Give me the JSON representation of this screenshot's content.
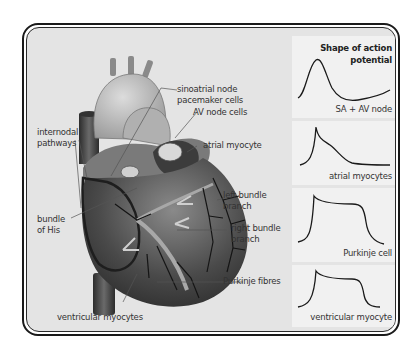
{
  "diagram": {
    "heart_labels": {
      "sinoatrial_line1": "sinoatrial node",
      "sinoatrial_line2": "pacemaker cells",
      "av_node": "AV node cells",
      "internodal_line1": "internodal",
      "internodal_line2": "pathways",
      "atrial_myocyte": "atrial myocyte",
      "left_bundle_line1": "left bundle",
      "left_bundle_line2": "branch",
      "right_bundle_line1": "right bundle",
      "right_bundle_line2": "branch",
      "bundle_his_line1": "bundle",
      "bundle_his_line2": "of His",
      "purkinje_fibres": "Purkinje fibres",
      "ventricular_myocytes": "ventricular myocytes"
    },
    "action_potential_panel": {
      "title_line1": "Shape of action",
      "title_line2": "potential",
      "panels": [
        {
          "label": "SA + AV node",
          "shape": "slow-rise-peak"
        },
        {
          "label": "atrial myocytes",
          "shape": "spike-decay"
        },
        {
          "label": "Purkinje cell",
          "shape": "spike-plateau-long"
        },
        {
          "label": "ventricular myocyte",
          "shape": "spike-plateau"
        }
      ]
    },
    "colors": {
      "background": "#e4e4e4",
      "panel": "#f1f1f1",
      "frame": "#1a1a1a",
      "heart_dark": "#3a3a3a",
      "heart_light": "#bdbdbd"
    }
  }
}
